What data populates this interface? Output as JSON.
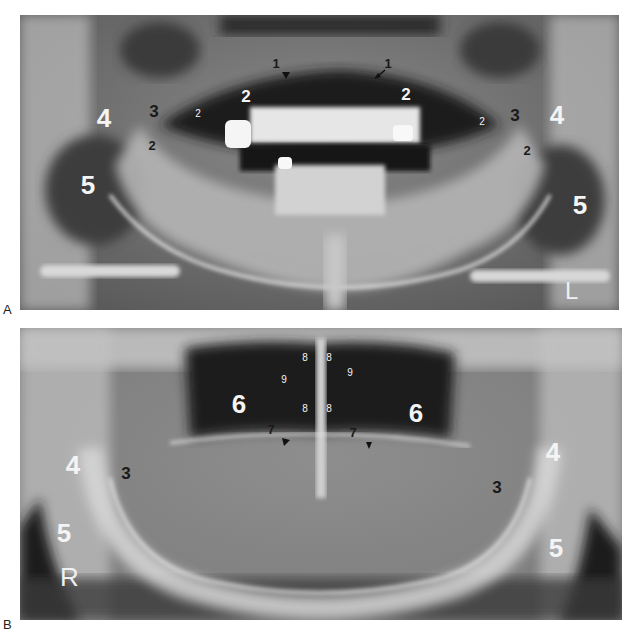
{
  "figure": {
    "panels": [
      {
        "letter": "A",
        "side_marker": "L",
        "labels": {
          "l1a": "1",
          "l1b": "1",
          "l2a": "2",
          "l2b": "2",
          "l2c": "2",
          "l2d": "2",
          "l2e": "2",
          "l2f": "2",
          "l3a": "3",
          "l3b": "3",
          "l4a": "4",
          "l4b": "4",
          "l5a": "5",
          "l5b": "5"
        }
      },
      {
        "letter": "B",
        "side_marker": "R",
        "labels": {
          "l3a": "3",
          "l3b": "3",
          "l4a": "4",
          "l4b": "4",
          "l5a": "5",
          "l5b": "5",
          "l6a": "6",
          "l6b": "6",
          "l7a": "7",
          "l7b": "7",
          "l8a": "8",
          "l8b": "8",
          "l8c": "8",
          "l8d": "8",
          "l9a": "9",
          "l9b": "9"
        }
      }
    ]
  }
}
